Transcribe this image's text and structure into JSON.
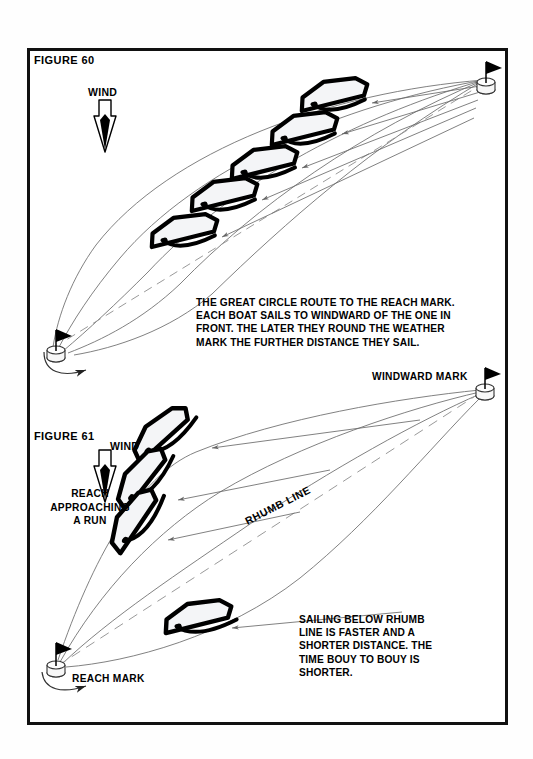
{
  "page": {
    "background_color": "#fefefe",
    "frame_color": "#111111"
  },
  "figure60": {
    "label": "FIGURE 60",
    "wind_label": "WIND",
    "wind_direction": "down",
    "caption": "THE GREAT CIRCLE ROUTE TO THE REACH MARK. EACH BOAT SAILS TO WINDWARD OF THE ONE IN FRONT. THE LATER THEY ROUND THE WEATHER MARK THE FURTHER DISTANCE THEY SAIL.",
    "caption_lines": [
      "THE GREAT CIRCLE ROUTE TO THE REACH MARK.",
      "EACH BOAT SAILS TO WINDWARD OF THE ONE IN",
      "FRONT. THE LATER THEY ROUND THE WEATHER",
      "MARK THE FURTHER DISTANCE THEY SAIL."
    ],
    "boat_count": 5,
    "arc_count": 5,
    "start_mark": "weather-mark-top-right",
    "end_mark": "reach-mark-bottom-left",
    "rhumb_line": "dashed"
  },
  "figure61": {
    "label": "FIGURE 61",
    "wind_label": "WIND",
    "wind_direction": "down",
    "reach_run_label": "REACH APPROACHING A RUN",
    "reach_run_lines": [
      "REACH",
      "APPROACHING",
      "A  RUN"
    ],
    "rhumb_line_label": "RHUMB LINE",
    "windward_mark_label": "WINDWARD MARK",
    "reach_mark_label": "REACH MARK",
    "caption": "SAILING BELOW RHUMB LINE IS FASTER AND A SHORTER DISTANCE. THE TIME BOUY TO BOUY IS SHORTER.",
    "caption_lines": [
      "SAILING BELOW RHUMB",
      "LINE IS FASTER AND A",
      "SHORTER DISTANCE. THE",
      "TIME BOUY TO BOUY IS",
      "SHORTER."
    ],
    "boat_count": 4,
    "track_count": 4
  },
  "colors": {
    "ink": "#000000",
    "line": "#555555",
    "sail_fill": "#f4f5f7",
    "paper": "#ffffff"
  }
}
